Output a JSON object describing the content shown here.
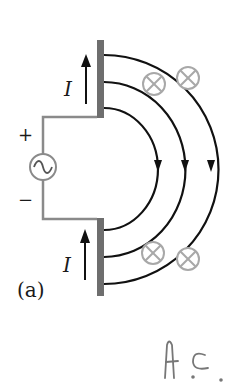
{
  "figure": {
    "panel_label": "(a)",
    "current_label": "I",
    "plus_sign": "+",
    "minus_sign": "−",
    "source_symbol": "~",
    "handwritten_note": "A.C."
  },
  "components": {
    "source": {
      "type": "ac-voltage-source",
      "icon": "sine-wave-icon"
    },
    "plates": [
      {
        "name": "upper-plate",
        "current_direction": "up"
      },
      {
        "name": "lower-plate",
        "current_direction": "up"
      }
    ],
    "field_lines": {
      "count": 3,
      "direction": "clockwise-downward"
    },
    "into_page_markers": {
      "count": 4,
      "symbol": "circle-cross-icon"
    }
  },
  "colors": {
    "wire": "#8a8a8a",
    "plate": "#6e6e6e",
    "field_line": "#111111",
    "marker": "#a8a8a8",
    "text": "#1a1a1a",
    "handwriting": "#777777"
  }
}
